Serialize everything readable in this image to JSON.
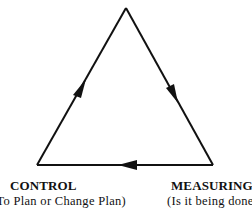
{
  "diagram": {
    "type": "cycle-triangle",
    "stroke_color": "#111111",
    "background": "#ffffff",
    "nodes": [
      {
        "id": "top",
        "title": "",
        "subtitle": ""
      },
      {
        "id": "control",
        "title": "CONTROL",
        "subtitle": "(To Plan or Change Plan)"
      },
      {
        "id": "measuring",
        "title": "MEASURING",
        "subtitle": "(Is it being done"
      }
    ],
    "edges": [
      {
        "from": "top",
        "to": "measuring",
        "arrow": "down-right"
      },
      {
        "from": "measuring",
        "to": "control",
        "arrow": "left"
      },
      {
        "from": "control",
        "to": "top",
        "arrow": "up-right"
      }
    ]
  }
}
